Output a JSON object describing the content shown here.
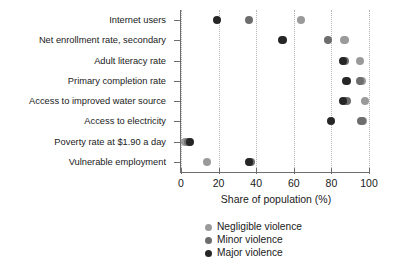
{
  "chart_data": {
    "type": "scatter",
    "title": "",
    "xlabel": "Share of population (%)",
    "ylabel": "",
    "xlim": [
      0,
      100
    ],
    "xticks": [
      0,
      20,
      40,
      60,
      80,
      100
    ],
    "xtick_labels": [
      "0",
      "20",
      "40",
      "60",
      "80",
      "100"
    ],
    "grid": "vertical dotted gridlines at each x tick",
    "legend_position": "below axis, centered",
    "orientation": "horizontal dot plot",
    "categories": [
      "Internet users",
      "Net enrollment rate, secondary",
      "Adult literacy rate",
      "Primary completion rate",
      "Access to improved water source",
      "Access to electricity",
      "Poverty rate at $1.90 a day",
      "Vulnerable employment"
    ],
    "series": [
      {
        "name": "Negligible violence",
        "color": "#9a9a9a",
        "values": [
          64,
          87,
          95,
          96,
          98,
          97,
          2,
          14
        ]
      },
      {
        "name": "Minor violence",
        "color": "#6d6d6d",
        "values": [
          36,
          78,
          87,
          95,
          88,
          96,
          4,
          37
        ]
      },
      {
        "name": "Major violence",
        "color": "#262626",
        "values": [
          19,
          54,
          86,
          88,
          86,
          80,
          5,
          36
        ]
      }
    ]
  },
  "legend": {
    "items": [
      {
        "label": "Negligible violence",
        "color": "#9a9a9a"
      },
      {
        "label": "Minor violence",
        "color": "#6d6d6d"
      },
      {
        "label": "Major violence",
        "color": "#262626"
      }
    ]
  }
}
